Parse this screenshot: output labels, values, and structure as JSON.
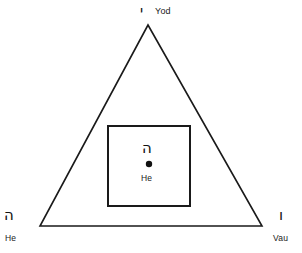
{
  "figure": {
    "type": "tetragrammaton-diagram",
    "background_color": "#ffffff",
    "stroke_color": "#1a1a1a",
    "triangle": {
      "apex": {
        "x": 148,
        "y": 25
      },
      "base_left": {
        "x": 40,
        "y": 226
      },
      "base_right": {
        "x": 262,
        "y": 226
      },
      "stroke_width": 1.6
    },
    "square": {
      "left": 108,
      "top": 126,
      "width": 82,
      "height": 80,
      "stroke_width": 2
    },
    "center_dot": {
      "cx": 149,
      "cy": 164,
      "r": 3.2,
      "fill": "#111111"
    }
  },
  "labels": {
    "apex": {
      "hebrew": "י",
      "roman": "Yod"
    },
    "bottom_left": {
      "hebrew": "ה",
      "roman": "He"
    },
    "bottom_right": {
      "hebrew": "ו",
      "roman": "Vau"
    },
    "center": {
      "hebrew": "ה",
      "roman": "He"
    }
  }
}
